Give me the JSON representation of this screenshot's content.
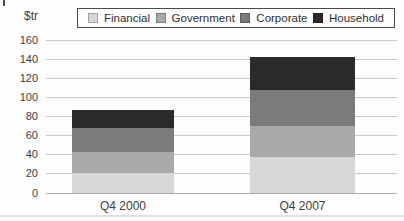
{
  "chart_data": {
    "type": "bar",
    "stacked": true,
    "title": "",
    "ylabel": "$tr",
    "xlabel": "",
    "categories": [
      "Q4 2000",
      "Q4 2007"
    ],
    "series": [
      {
        "name": "Financial",
        "color": "#d7d7d7",
        "values": [
          20,
          37
        ]
      },
      {
        "name": "Government",
        "color": "#a9a9a9",
        "values": [
          22,
          33
        ]
      },
      {
        "name": "Corporate",
        "color": "#7b7b7b",
        "values": [
          26,
          38
        ]
      },
      {
        "name": "Household",
        "color": "#2b2b2b",
        "values": [
          19,
          34
        ]
      }
    ],
    "totals": [
      87,
      142
    ],
    "ylim": [
      0,
      160
    ],
    "yticks": [
      0,
      20,
      40,
      60,
      80,
      100,
      120,
      140,
      160
    ],
    "grid": true,
    "legend_position": "top"
  },
  "colors": {
    "grid": "#c9c9c9",
    "axis_text": "#3d3d3d",
    "legend_border": "#4a4a4a",
    "background": "#fefefe"
  }
}
